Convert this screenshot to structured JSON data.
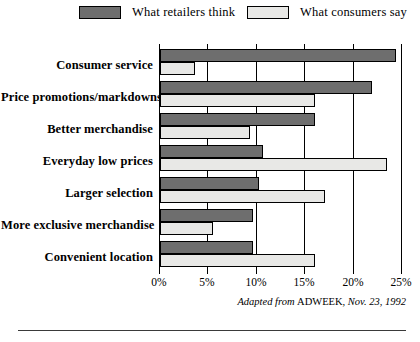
{
  "legend": {
    "items": [
      {
        "label": "What retailers think",
        "swatch": "dark",
        "color": "#6e6e6e"
      },
      {
        "label": "What consumers say",
        "swatch": "light",
        "color": "#e8e8e6"
      }
    ]
  },
  "footer": {
    "attribution_prefix": "Adapted from ",
    "source": "ADWEEK",
    "attribution_suffix": ", Nov. 23, 1992",
    "full_text": "Adapted from ADWEEK, Nov. 23, 1992"
  },
  "chart_data": {
    "type": "bar",
    "orientation": "horizontal",
    "title": "",
    "xlabel": "",
    "ylabel": "",
    "xlim": [
      0,
      25
    ],
    "grid": true,
    "legend_position": "top",
    "tick_labels": [
      "0%",
      "5%",
      "10%",
      "15%",
      "20%",
      "25%"
    ],
    "tick_values": [
      0,
      5,
      10,
      15,
      20,
      25
    ],
    "categories": [
      "Consumer service",
      "Price promotions/markdowns",
      "Better merchandise",
      "Everyday low prices",
      "Larger selection",
      "More exclusive merchandise",
      "Convenient location"
    ],
    "series": [
      {
        "name": "What retailers think",
        "color": "#6e6e6e",
        "values": [
          24.4,
          21.9,
          16.0,
          10.6,
          10.2,
          9.6,
          9.6
        ]
      },
      {
        "name": "What consumers say",
        "color": "#e8e8e6",
        "values": [
          3.6,
          16.0,
          9.3,
          23.4,
          17.0,
          5.5,
          16.0
        ]
      }
    ]
  }
}
